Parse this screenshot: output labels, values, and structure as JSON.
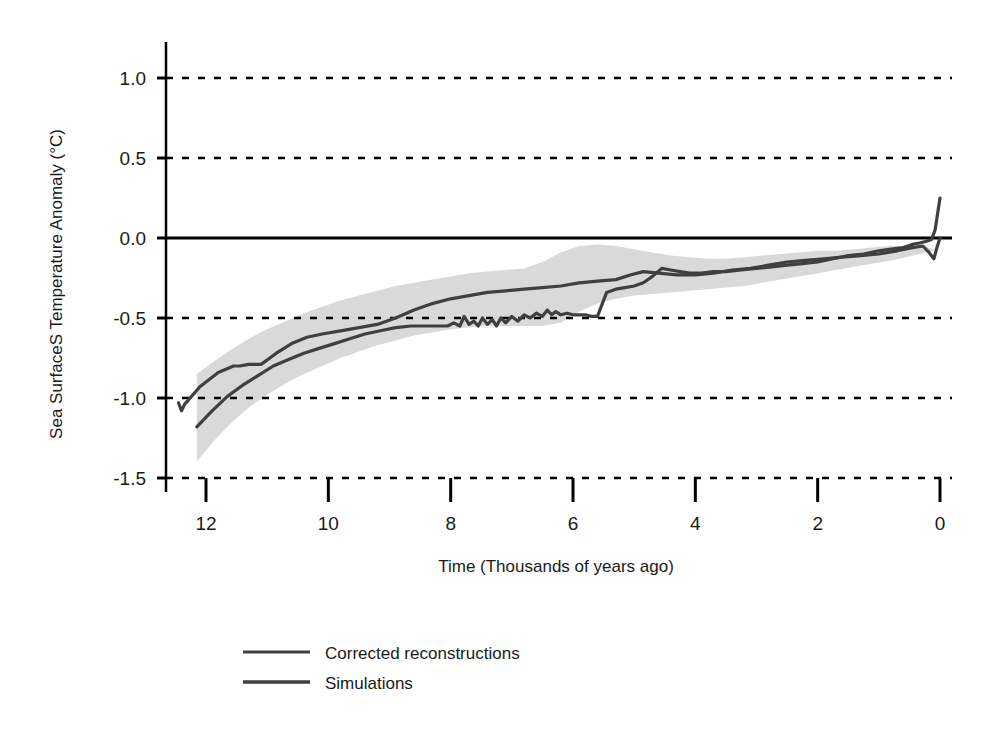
{
  "chart_data": {
    "type": "line",
    "title": "",
    "subtitle": "",
    "xlabel": "Time (Thousands of years ago)",
    "ylabel": "Sea SurfaceS Temperature Anomaly (°C)",
    "xlim": [
      12.6,
      0.0
    ],
    "ylim": [
      -1.5,
      1.2
    ],
    "x_reversed": true,
    "grid": "horizontal-dashed",
    "gridlines_y": [
      1.0,
      0.5,
      -0.5,
      -1.0,
      -1.5
    ],
    "zero_line": 0.0,
    "xticks": [
      12,
      10,
      8,
      6,
      4,
      2,
      0
    ],
    "xtick_labels": [
      "12",
      "10",
      "8",
      "6",
      "4",
      "2",
      "0"
    ],
    "yticks": [
      1.0,
      0.5,
      0.0,
      -0.5,
      -1.0,
      -1.5
    ],
    "ytick_labels": [
      "1.0",
      "0.5",
      "0.0",
      "-0.5",
      "-1.0",
      "-1.5"
    ],
    "legend_position": "below-left",
    "colors": {
      "line": "#3f3f3f",
      "band": "#d9d9d9",
      "axis": "#000000",
      "text": "#1a1a1a"
    },
    "series": [
      {
        "name": "Corrected reconstructions",
        "style": "solid",
        "color": "#3f3f3f",
        "x": [
          12.45,
          12.4,
          12.35,
          12.1,
          11.8,
          11.55,
          11.45,
          11.3,
          11.1,
          10.85,
          10.6,
          10.35,
          10.1,
          9.8,
          9.5,
          9.2,
          8.9,
          8.6,
          8.3,
          8.0,
          7.7,
          7.4,
          7.1,
          6.8,
          6.5,
          6.2,
          5.9,
          5.6,
          5.3,
          5.05,
          4.85,
          4.6,
          4.3,
          4.0,
          3.7,
          3.4,
          3.1,
          2.8,
          2.5,
          2.2,
          1.9,
          1.6,
          1.3,
          1.0,
          0.7,
          0.45,
          0.28,
          0.18,
          0.1,
          0.05,
          0.0
        ],
        "y": [
          -1.03,
          -1.08,
          -1.04,
          -0.93,
          -0.84,
          -0.8,
          -0.8,
          -0.79,
          -0.79,
          -0.72,
          -0.66,
          -0.62,
          -0.6,
          -0.58,
          -0.56,
          -0.54,
          -0.5,
          -0.45,
          -0.41,
          -0.38,
          -0.36,
          -0.34,
          -0.33,
          -0.32,
          -0.31,
          -0.3,
          -0.28,
          -0.27,
          -0.26,
          -0.23,
          -0.21,
          -0.22,
          -0.23,
          -0.23,
          -0.22,
          -0.2,
          -0.19,
          -0.17,
          -0.15,
          -0.14,
          -0.13,
          -0.12,
          -0.11,
          -0.1,
          -0.08,
          -0.06,
          -0.05,
          -0.09,
          -0.13,
          -0.06,
          0.0
        ]
      },
      {
        "name": "Simulations",
        "style": "solid",
        "color": "#3f3f3f",
        "x": [
          12.15,
          11.9,
          11.65,
          11.4,
          11.15,
          10.9,
          10.65,
          10.4,
          10.15,
          9.9,
          9.65,
          9.4,
          9.15,
          8.9,
          8.65,
          8.4,
          8.2,
          8.05,
          7.95,
          7.85,
          7.78,
          7.7,
          7.62,
          7.55,
          7.48,
          7.4,
          7.32,
          7.25,
          7.18,
          7.1,
          7.0,
          6.9,
          6.8,
          6.7,
          6.6,
          6.5,
          6.42,
          6.35,
          6.28,
          6.2,
          6.1,
          6.0,
          5.9,
          5.8,
          5.7,
          5.6,
          5.45,
          5.3,
          5.15,
          5.0,
          4.85,
          4.7,
          4.55,
          4.4,
          4.25,
          4.1,
          3.9,
          3.7,
          3.5,
          3.25,
          3.0,
          2.75,
          2.5,
          2.25,
          2.0,
          1.75,
          1.5,
          1.25,
          1.0,
          0.8,
          0.6,
          0.45,
          0.32,
          0.22,
          0.14,
          0.08,
          0.04,
          0.0
        ],
        "y": [
          -1.18,
          -1.08,
          -0.99,
          -0.92,
          -0.86,
          -0.8,
          -0.76,
          -0.72,
          -0.69,
          -0.66,
          -0.63,
          -0.6,
          -0.58,
          -0.56,
          -0.55,
          -0.55,
          -0.55,
          -0.55,
          -0.53,
          -0.55,
          -0.49,
          -0.54,
          -0.52,
          -0.55,
          -0.5,
          -0.54,
          -0.51,
          -0.55,
          -0.5,
          -0.53,
          -0.49,
          -0.52,
          -0.48,
          -0.5,
          -0.47,
          -0.49,
          -0.45,
          -0.48,
          -0.46,
          -0.48,
          -0.47,
          -0.48,
          -0.48,
          -0.48,
          -0.49,
          -0.49,
          -0.34,
          -0.32,
          -0.31,
          -0.3,
          -0.28,
          -0.24,
          -0.19,
          -0.2,
          -0.21,
          -0.22,
          -0.22,
          -0.21,
          -0.21,
          -0.2,
          -0.19,
          -0.18,
          -0.17,
          -0.16,
          -0.15,
          -0.13,
          -0.11,
          -0.1,
          -0.08,
          -0.07,
          -0.06,
          -0.04,
          -0.03,
          -0.02,
          -0.01,
          0.05,
          0.15,
          0.25
        ]
      }
    ],
    "band": {
      "name": "uncertainty-band",
      "color": "#d9d9d9",
      "x": [
        12.15,
        11.9,
        11.6,
        11.3,
        11.0,
        10.7,
        10.4,
        10.1,
        9.8,
        9.5,
        9.2,
        8.9,
        8.6,
        8.3,
        8.0,
        7.7,
        7.4,
        7.1,
        6.8,
        6.5,
        6.2,
        5.9,
        5.6,
        5.3,
        5.0,
        4.7,
        4.4,
        4.1,
        3.8,
        3.5,
        3.2,
        2.9,
        2.6,
        2.3,
        2.0,
        1.7,
        1.4,
        1.1,
        0.8,
        0.55,
        0.35,
        0.2,
        0.1
      ],
      "upper": [
        -0.85,
        -0.78,
        -0.7,
        -0.63,
        -0.57,
        -0.52,
        -0.47,
        -0.43,
        -0.39,
        -0.36,
        -0.33,
        -0.3,
        -0.28,
        -0.26,
        -0.24,
        -0.22,
        -0.21,
        -0.2,
        -0.19,
        -0.15,
        -0.09,
        -0.05,
        -0.04,
        -0.05,
        -0.07,
        -0.09,
        -0.11,
        -0.12,
        -0.13,
        -0.13,
        -0.12,
        -0.11,
        -0.1,
        -0.09,
        -0.08,
        -0.08,
        -0.07,
        -0.06,
        -0.05,
        -0.05,
        -0.05,
        -0.06,
        -0.07
      ],
      "lower": [
        -1.4,
        -1.28,
        -1.16,
        -1.06,
        -0.98,
        -0.91,
        -0.85,
        -0.8,
        -0.75,
        -0.71,
        -0.67,
        -0.64,
        -0.61,
        -0.59,
        -0.57,
        -0.56,
        -0.55,
        -0.55,
        -0.55,
        -0.55,
        -0.53,
        -0.46,
        -0.41,
        -0.38,
        -0.36,
        -0.35,
        -0.34,
        -0.33,
        -0.32,
        -0.31,
        -0.3,
        -0.28,
        -0.26,
        -0.24,
        -0.22,
        -0.2,
        -0.18,
        -0.16,
        -0.14,
        -0.12,
        -0.1,
        -0.09,
        -0.08
      ]
    }
  },
  "axes": {
    "y_title": "Sea SurfaceS Temperature Anomaly (°C)",
    "x_title": "Time (Thousands of years ago)",
    "y_ticks": [
      {
        "label": "1.0",
        "value": 1.0
      },
      {
        "label": "0.5",
        "value": 0.5
      },
      {
        "label": "0.0",
        "value": 0.0
      },
      {
        "label": "-0.5",
        "value": -0.5
      },
      {
        "label": "-1.0",
        "value": -1.0
      },
      {
        "label": "-1.5",
        "value": -1.5
      }
    ],
    "x_ticks": [
      {
        "label": "12",
        "value": 12
      },
      {
        "label": "10",
        "value": 10
      },
      {
        "label": "8",
        "value": 8
      },
      {
        "label": "6",
        "value": 6
      },
      {
        "label": "4",
        "value": 4
      },
      {
        "label": "2",
        "value": 2
      },
      {
        "label": "0",
        "value": 0
      }
    ]
  },
  "legend": {
    "items": [
      {
        "label": "Corrected reconstructions",
        "color": "#3f3f3f"
      },
      {
        "label": "Simulations",
        "color": "#3f3f3f"
      }
    ]
  }
}
